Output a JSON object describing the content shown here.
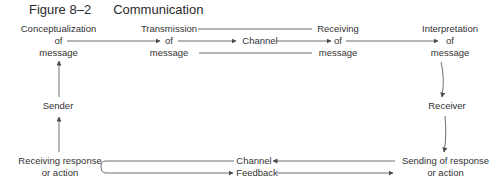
{
  "figure": {
    "number": "Figure 8–2",
    "title": "Communication"
  },
  "nodes": {
    "conceptualization": [
      "Conceptualization",
      "of",
      "message"
    ],
    "transmission": [
      "Transmission",
      "of",
      "message"
    ],
    "channel_top": "Channel",
    "receiving": [
      "Receiving",
      "of",
      "message"
    ],
    "interpretation": [
      "Interpretation",
      "of",
      "message"
    ],
    "receiver": "Receiver",
    "sending_response": [
      "Sending of response",
      "or action"
    ],
    "channel_bottom": "Channel",
    "feedback": "Feedback",
    "receiving_response": [
      "Receiving response",
      "or action"
    ],
    "sender": "Sender"
  },
  "colors": {
    "line": "#4a4a4a",
    "text": "#333333"
  }
}
